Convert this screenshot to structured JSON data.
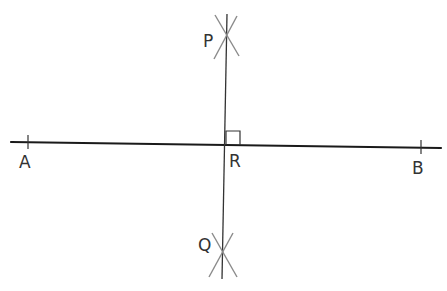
{
  "diagram": {
    "colors": {
      "main_line": "#1a1a1a",
      "perpendicular": "#333333",
      "arcs": "#8a8a8a",
      "labels": "#333333"
    },
    "segment_AB": {
      "x1": 11,
      "y1": 142,
      "x2": 441,
      "y2": 148
    },
    "perpendicular_PQ": {
      "x1": 227,
      "y1": 14,
      "x2": 222,
      "y2": 279
    },
    "right_angle_marker": {
      "x": 226,
      "y": 131,
      "size": 14
    },
    "points": [
      {
        "id": "A",
        "label": "A",
        "x": 28,
        "y": 142,
        "tick": true,
        "label_x": 19,
        "label_y": 154
      },
      {
        "id": "B",
        "label": "B",
        "x": 421,
        "y": 147,
        "tick": true,
        "label_x": 412,
        "label_y": 160
      },
      {
        "id": "R",
        "label": "R",
        "x": 226,
        "y": 145,
        "tick": false,
        "label_x": 229,
        "label_y": 153
      },
      {
        "id": "P",
        "label": "P",
        "x": 226,
        "y": 37,
        "tick": false,
        "label_x": 203,
        "label_y": 33
      },
      {
        "id": "Q",
        "label": "Q",
        "x": 223,
        "y": 254,
        "tick": false,
        "label_x": 198,
        "label_y": 237
      }
    ],
    "arc_crosses": [
      {
        "at": "P",
        "x": 226,
        "y": 37
      },
      {
        "at": "Q",
        "x": 223,
        "y": 254
      }
    ]
  }
}
